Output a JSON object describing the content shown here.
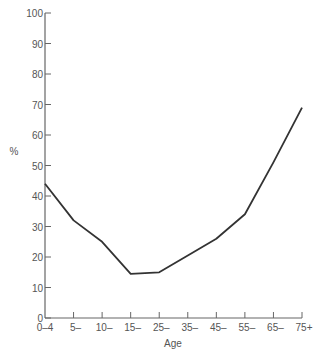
{
  "chart_data": {
    "type": "line",
    "title": "",
    "xlabel": "Age",
    "ylabel": "%",
    "categories": [
      "0–4",
      "5–",
      "10–",
      "15–",
      "25–",
      "35–",
      "45–",
      "55–",
      "65–",
      "75+"
    ],
    "values": [
      44,
      32,
      25,
      14.5,
      15,
      20.5,
      26,
      34,
      51,
      69
    ],
    "ylim": [
      0,
      100
    ],
    "yticks": [
      0,
      10,
      20,
      30,
      40,
      50,
      60,
      70,
      80,
      90,
      100
    ],
    "grid": false,
    "legend": null,
    "colors": {
      "line": "#333333",
      "axis": "#666666",
      "text": "#555555"
    }
  }
}
